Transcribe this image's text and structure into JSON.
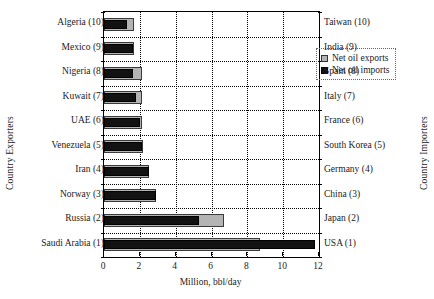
{
  "chart_data": {
    "type": "bar",
    "orientation": "horizontal",
    "title": "",
    "xlabel": "Million, bbl/day",
    "ylabel_left": "Country Exporters",
    "ylabel_right": "Country Importers",
    "xlim": [
      0,
      12
    ],
    "xticks": [
      0,
      2,
      4,
      6,
      8,
      10,
      12
    ],
    "grid": true,
    "legend_position": "top-center",
    "legend": [
      {
        "name": "Net oil exports",
        "color": "#b4b4b4"
      },
      {
        "name": "Net oil imports",
        "color": "#121212"
      }
    ],
    "categories_left": [
      "Algeria (10)",
      "Mexico (9)",
      "Nigeria (8)",
      "Kuwait (7)",
      "UAE (6)",
      "Venezuela (5)",
      "Iran (4)",
      "Norway (3)",
      "Russia (2)",
      "Saudi Arabia (1)"
    ],
    "categories_right": [
      "Taiwan (10)",
      "India (9)",
      "Spain (8)",
      "Italy (7)",
      "France (6)",
      "South Korea (5)",
      "Germany (4)",
      "China (3)",
      "Japan (2)",
      "USA (1)"
    ],
    "series": [
      {
        "name": "Net oil exports",
        "color": "#b4b4b4",
        "values": [
          1.7,
          1.7,
          2.1,
          2.1,
          2.1,
          2.2,
          2.5,
          2.9,
          6.7,
          8.7
        ]
      },
      {
        "name": "Net oil imports",
        "color": "#121212",
        "values": [
          1.3,
          1.6,
          1.6,
          1.8,
          2.0,
          2.1,
          2.5,
          2.9,
          5.3,
          11.8
        ]
      }
    ]
  },
  "axis": {
    "x_tick_labels": [
      "0",
      "2",
      "4",
      "6",
      "8",
      "10",
      "12"
    ]
  }
}
